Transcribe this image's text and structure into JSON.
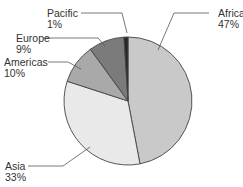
{
  "chart_data": {
    "type": "pie",
    "title": "",
    "categories": [
      "Africa",
      "Asia",
      "Americas",
      "Europe",
      "Pacific"
    ],
    "values": [
      47,
      33,
      10,
      9,
      1
    ],
    "unit": "%",
    "colors": [
      "#c9c9c9",
      "#e9e9e9",
      "#a9a9a9",
      "#7b7b7b",
      "#262626"
    ],
    "start_angle": "12 o'clock",
    "direction": "clockwise",
    "legend": "none (callout labels)"
  },
  "labels": [
    {
      "name": "Africa",
      "pct": "47%"
    },
    {
      "name": "Asia",
      "pct": "33%"
    },
    {
      "name": "Americas",
      "pct": "10%"
    },
    {
      "name": "Europe",
      "pct": "9%"
    },
    {
      "name": "Pacific",
      "pct": "1%"
    }
  ]
}
